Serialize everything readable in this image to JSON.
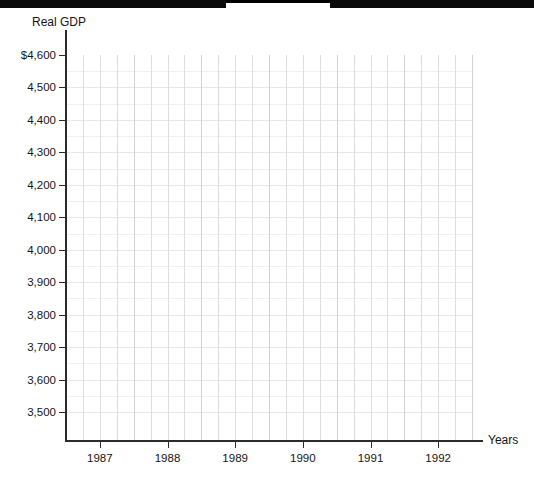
{
  "figure": {
    "y_axis_title": "Real GDP",
    "x_axis_title": "Years",
    "watermark_top": "",
    "watermark_bottom": ""
  },
  "chart_data": {
    "type": "line",
    "title": "",
    "subtitle": "",
    "xlabel": "Years",
    "ylabel": "Real GDP",
    "series": [],
    "categories": [],
    "x": [],
    "values": [],
    "annotations": [],
    "legend": [],
    "legend_position": "none",
    "grid": true,
    "grid_minor_x_count": 24,
    "grid_minor_per_major_x": 4,
    "note": "Blank/empty graph template: axes and gridlines drawn, no data plotted.",
    "ylim": [
      3400,
      4600
    ],
    "ytick_labels": [
      "$4,600",
      "4,500",
      "4,400",
      "4,300",
      "4,200",
      "4,100",
      "4,000",
      "3,900",
      "3,800",
      "3,700",
      "3,600",
      "3,500"
    ],
    "ytick_values": [
      4600,
      4500,
      4400,
      4300,
      4200,
      4100,
      4000,
      3900,
      3800,
      3700,
      3600,
      3500
    ],
    "xlim": [
      1986.5,
      1992.75
    ],
    "xtick_labels": [
      "1987",
      "1988",
      "1989",
      "1990",
      "1991",
      "1992"
    ],
    "xtick_values": [
      1987,
      1988,
      1989,
      1990,
      1991,
      1992
    ]
  },
  "colors": {
    "axis": "#2b2b2b",
    "grid_vertical": "#dedede",
    "grid_horizontal": "#e8e8e8",
    "text": "#141414",
    "background": "#ffffff",
    "scan_bar": "#0a0a0a"
  }
}
